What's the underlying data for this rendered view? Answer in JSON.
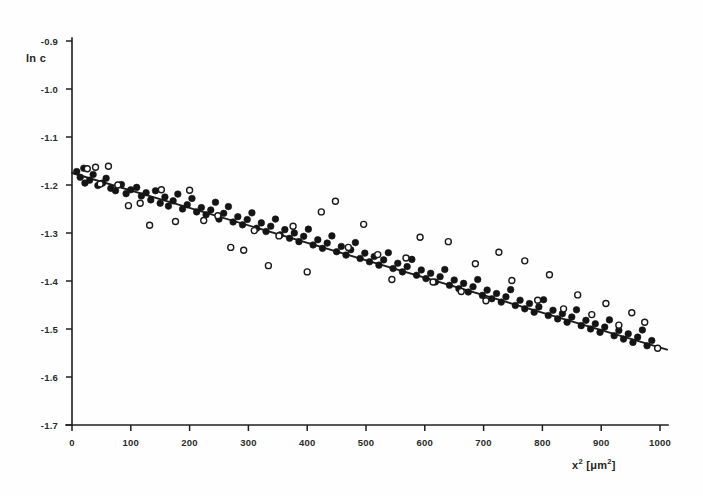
{
  "figure": {
    "background_color": "#fefefe",
    "ink_color": "#1f1f1f",
    "width": 703,
    "height": 496
  },
  "axes": {
    "y_title": "ln c",
    "x_title_base": "x",
    "x_title_exp": "2",
    "x_title_unit_open": " [",
    "x_title_unit": "μm",
    "x_title_unit_exp": "2",
    "x_title_unit_close": "]",
    "x_title_full": "x2 [μm2]",
    "y_ticks": [
      "-0.9",
      "-1.0",
      "-1.1",
      "-1.2",
      "-1.3",
      "-1.4",
      "-1.5",
      "-1.6",
      "-1.7"
    ],
    "x_ticks": [
      "0",
      "100",
      "200",
      "300",
      "400",
      "500",
      "600",
      "700",
      "800",
      "900",
      "1000"
    ]
  },
  "chart_data": {
    "type": "scatter",
    "title": "",
    "subtitle": "",
    "xlabel": "x2 [μm2]",
    "ylabel": "ln c",
    "xlim": [
      0,
      1030
    ],
    "ylim": [
      -1.7,
      -0.9
    ],
    "grid": false,
    "legend": "none",
    "annotations": [],
    "series": [
      {
        "name": "filled-circles",
        "marker": "filled-circle",
        "color": "#141414",
        "points": [
          [
            8,
            -1.172
          ],
          [
            14,
            -1.184
          ],
          [
            20,
            -1.165
          ],
          [
            22,
            -1.196
          ],
          [
            30,
            -1.19
          ],
          [
            36,
            -1.178
          ],
          [
            44,
            -1.201
          ],
          [
            52,
            -1.196
          ],
          [
            58,
            -1.186
          ],
          [
            66,
            -1.207
          ],
          [
            74,
            -1.212
          ],
          [
            84,
            -1.199
          ],
          [
            92,
            -1.218
          ],
          [
            100,
            -1.21
          ],
          [
            110,
            -1.205
          ],
          [
            118,
            -1.223
          ],
          [
            126,
            -1.216
          ],
          [
            134,
            -1.231
          ],
          [
            142,
            -1.212
          ],
          [
            150,
            -1.238
          ],
          [
            158,
            -1.225
          ],
          [
            164,
            -1.244
          ],
          [
            172,
            -1.233
          ],
          [
            180,
            -1.219
          ],
          [
            188,
            -1.25
          ],
          [
            196,
            -1.241
          ],
          [
            204,
            -1.228
          ],
          [
            212,
            -1.256
          ],
          [
            220,
            -1.247
          ],
          [
            228,
            -1.262
          ],
          [
            236,
            -1.252
          ],
          [
            244,
            -1.236
          ],
          [
            250,
            -1.271
          ],
          [
            258,
            -1.259
          ],
          [
            266,
            -1.245
          ],
          [
            274,
            -1.277
          ],
          [
            282,
            -1.266
          ],
          [
            290,
            -1.283
          ],
          [
            298,
            -1.272
          ],
          [
            306,
            -1.258
          ],
          [
            314,
            -1.29
          ],
          [
            322,
            -1.279
          ],
          [
            330,
            -1.297
          ],
          [
            338,
            -1.286
          ],
          [
            346,
            -1.271
          ],
          [
            354,
            -1.304
          ],
          [
            362,
            -1.293
          ],
          [
            370,
            -1.311
          ],
          [
            378,
            -1.3
          ],
          [
            386,
            -1.318
          ],
          [
            394,
            -1.307
          ],
          [
            402,
            -1.292
          ],
          [
            410,
            -1.325
          ],
          [
            418,
            -1.314
          ],
          [
            426,
            -1.332
          ],
          [
            434,
            -1.321
          ],
          [
            442,
            -1.306
          ],
          [
            450,
            -1.339
          ],
          [
            458,
            -1.328
          ],
          [
            466,
            -1.346
          ],
          [
            474,
            -1.335
          ],
          [
            482,
            -1.32
          ],
          [
            490,
            -1.353
          ],
          [
            498,
            -1.342
          ],
          [
            506,
            -1.36
          ],
          [
            514,
            -1.349
          ],
          [
            522,
            -1.367
          ],
          [
            530,
            -1.356
          ],
          [
            538,
            -1.341
          ],
          [
            546,
            -1.374
          ],
          [
            554,
            -1.363
          ],
          [
            562,
            -1.381
          ],
          [
            570,
            -1.37
          ],
          [
            578,
            -1.355
          ],
          [
            586,
            -1.388
          ],
          [
            594,
            -1.377
          ],
          [
            602,
            -1.395
          ],
          [
            610,
            -1.384
          ],
          [
            618,
            -1.402
          ],
          [
            626,
            -1.391
          ],
          [
            634,
            -1.376
          ],
          [
            642,
            -1.409
          ],
          [
            650,
            -1.398
          ],
          [
            658,
            -1.416
          ],
          [
            666,
            -1.405
          ],
          [
            674,
            -1.423
          ],
          [
            682,
            -1.412
          ],
          [
            690,
            -1.397
          ],
          [
            698,
            -1.43
          ],
          [
            706,
            -1.419
          ],
          [
            714,
            -1.437
          ],
          [
            722,
            -1.426
          ],
          [
            730,
            -1.444
          ],
          [
            738,
            -1.433
          ],
          [
            746,
            -1.418
          ],
          [
            754,
            -1.451
          ],
          [
            762,
            -1.44
          ],
          [
            770,
            -1.458
          ],
          [
            778,
            -1.447
          ],
          [
            786,
            -1.465
          ],
          [
            794,
            -1.454
          ],
          [
            802,
            -1.439
          ],
          [
            810,
            -1.472
          ],
          [
            818,
            -1.461
          ],
          [
            826,
            -1.479
          ],
          [
            834,
            -1.468
          ],
          [
            842,
            -1.486
          ],
          [
            850,
            -1.475
          ],
          [
            858,
            -1.46
          ],
          [
            866,
            -1.493
          ],
          [
            874,
            -1.482
          ],
          [
            882,
            -1.5
          ],
          [
            890,
            -1.489
          ],
          [
            898,
            -1.507
          ],
          [
            906,
            -1.496
          ],
          [
            914,
            -1.481
          ],
          [
            922,
            -1.514
          ],
          [
            930,
            -1.503
          ],
          [
            938,
            -1.521
          ],
          [
            946,
            -1.51
          ],
          [
            954,
            -1.528
          ],
          [
            962,
            -1.517
          ],
          [
            970,
            -1.502
          ],
          [
            978,
            -1.535
          ],
          [
            986,
            -1.524
          ]
        ]
      },
      {
        "name": "open-circles",
        "marker": "open-circle",
        "color": "#1a1a1a",
        "points": [
          [
            26,
            -1.166
          ],
          [
            40,
            -1.163
          ],
          [
            48,
            -1.198
          ],
          [
            62,
            -1.161
          ],
          [
            78,
            -1.2
          ],
          [
            96,
            -1.243
          ],
          [
            116,
            -1.238
          ],
          [
            132,
            -1.284
          ],
          [
            152,
            -1.21
          ],
          [
            176,
            -1.276
          ],
          [
            200,
            -1.211
          ],
          [
            224,
            -1.274
          ],
          [
            248,
            -1.264
          ],
          [
            270,
            -1.33
          ],
          [
            292,
            -1.336
          ],
          [
            310,
            -1.295
          ],
          [
            334,
            -1.368
          ],
          [
            352,
            -1.306
          ],
          [
            376,
            -1.286
          ],
          [
            400,
            -1.381
          ],
          [
            424,
            -1.256
          ],
          [
            448,
            -1.234
          ],
          [
            470,
            -1.33
          ],
          [
            496,
            -1.282
          ],
          [
            520,
            -1.345
          ],
          [
            544,
            -1.397
          ],
          [
            568,
            -1.352
          ],
          [
            592,
            -1.309
          ],
          [
            614,
            -1.402
          ],
          [
            640,
            -1.318
          ],
          [
            662,
            -1.422
          ],
          [
            686,
            -1.364
          ],
          [
            704,
            -1.441
          ],
          [
            726,
            -1.34
          ],
          [
            748,
            -1.399
          ],
          [
            770,
            -1.358
          ],
          [
            792,
            -1.44
          ],
          [
            812,
            -1.387
          ],
          [
            836,
            -1.458
          ],
          [
            860,
            -1.429
          ],
          [
            884,
            -1.47
          ],
          [
            908,
            -1.447
          ],
          [
            930,
            -1.492
          ],
          [
            952,
            -1.466
          ],
          [
            974,
            -1.486
          ],
          [
            996,
            -1.54
          ]
        ]
      }
    ],
    "fit_line": {
      "name": "linear-regression-line",
      "x_start": 0,
      "y_start": -1.175,
      "x_end": 1012,
      "y_end": -1.543,
      "slope": -0.000364,
      "intercept": -1.175
    }
  }
}
